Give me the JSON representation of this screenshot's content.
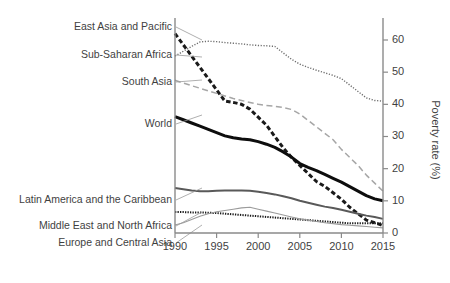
{
  "chart_data": {
    "type": "line",
    "title": "",
    "xlabel": "",
    "ylabel": "Poverty rate (%)",
    "xlim": [
      1990,
      2015
    ],
    "ylim": [
      0,
      65
    ],
    "grid": false,
    "legend_position": "left-labels-with-leader-lines",
    "x_ticks": [
      "1990",
      "1995",
      "2000",
      "2005",
      "2010",
      "2015"
    ],
    "y_ticks": [
      "0",
      "10",
      "20",
      "30",
      "40",
      "50",
      "60"
    ],
    "x": [
      1990,
      1991,
      1992,
      1993,
      1994,
      1995,
      1996,
      1997,
      1998,
      1999,
      2000,
      2001,
      2002,
      2003,
      2004,
      2005,
      2006,
      2007,
      2008,
      2009,
      2010,
      2011,
      2012,
      2013,
      2014,
      2015
    ],
    "series": [
      {
        "name": "East Asia and Pacific",
        "style": "thick-dashed",
        "color": "#1a1a1a",
        "values": [
          62.0,
          58.5,
          55.0,
          51.5,
          48.0,
          44.5,
          41.0,
          40.6,
          40.0,
          38.5,
          36.0,
          33.5,
          30.0,
          26.5,
          23.5,
          21.0,
          18.5,
          16.0,
          14.5,
          12.5,
          10.5,
          8.0,
          6.0,
          4.0,
          3.2,
          2.3
        ]
      },
      {
        "name": "Sub-Saharan Africa",
        "style": "fine-dotted",
        "color": "#6e6e6e",
        "values": [
          55.0,
          56.5,
          58.0,
          59.4,
          59.6,
          59.5,
          59.2,
          59.0,
          58.8,
          58.5,
          58.3,
          58.2,
          58.0,
          56.0,
          54.0,
          52.5,
          51.5,
          50.6,
          49.8,
          49.0,
          48.0,
          46.0,
          44.0,
          42.0,
          41.2,
          41.0
        ]
      },
      {
        "name": "South Asia",
        "style": "long-dashed",
        "color": "#a6a6a6",
        "values": [
          47.5,
          46.6,
          45.8,
          45.0,
          44.2,
          43.4,
          42.6,
          41.8,
          41.2,
          40.6,
          40.0,
          39.6,
          39.4,
          39.0,
          38.4,
          37.0,
          35.0,
          33.0,
          31.0,
          29.0,
          26.0,
          23.5,
          21.0,
          18.0,
          15.5,
          13.0
        ]
      },
      {
        "name": "World",
        "style": "thick-solid",
        "color": "#0d0d0d",
        "values": [
          36.2,
          35.2,
          34.2,
          33.2,
          32.2,
          31.2,
          30.2,
          29.6,
          29.2,
          29.0,
          28.4,
          27.6,
          26.6,
          25.2,
          23.6,
          21.6,
          20.4,
          19.4,
          18.2,
          17.0,
          15.8,
          14.4,
          13.0,
          11.6,
          10.6,
          10.0
        ]
      },
      {
        "name": "Latin America and the Caribbean",
        "style": "medium-solid",
        "color": "#595959",
        "values": [
          14.0,
          13.6,
          13.2,
          13.0,
          13.0,
          13.1,
          13.2,
          13.2,
          13.2,
          13.1,
          12.8,
          12.4,
          12.0,
          11.4,
          10.8,
          10.0,
          9.4,
          8.8,
          8.2,
          7.8,
          7.2,
          6.6,
          6.0,
          5.4,
          5.0,
          4.4
        ]
      },
      {
        "name": "Middle East and North Africa",
        "style": "fine-dotted-dark",
        "color": "#1a1a1a",
        "values": [
          6.5,
          6.5,
          6.4,
          6.4,
          6.3,
          6.2,
          6.0,
          5.8,
          5.6,
          5.4,
          5.2,
          5.0,
          4.8,
          4.6,
          4.4,
          4.2,
          4.0,
          3.8,
          3.6,
          3.4,
          3.2,
          3.0,
          3.0,
          3.0,
          3.0,
          3.0
        ]
      },
      {
        "name": "Europe and Central Asia",
        "style": "thin-solid",
        "color": "#9b9b9b",
        "values": [
          2.5,
          3.2,
          4.2,
          5.2,
          6.0,
          6.6,
          7.0,
          7.4,
          7.8,
          8.0,
          7.4,
          6.8,
          6.2,
          5.6,
          5.0,
          4.4,
          4.0,
          3.6,
          3.2,
          2.9,
          2.6,
          2.4,
          2.2,
          2.0,
          1.8,
          1.6
        ]
      }
    ],
    "label_anchors": [
      {
        "name": "East Asia and Pacific",
        "label_y": 27,
        "point_y": 40
      },
      {
        "name": "Sub-Saharan Africa",
        "label_y": 55,
        "point_y": 57
      },
      {
        "name": "South Asia",
        "label_y": 82,
        "point_y": 80
      },
      {
        "name": "World",
        "label_y": 124,
        "point_y": 115
      },
      {
        "name": "Latin America and the Caribbean",
        "label_y": 200,
        "point_y": 188
      },
      {
        "name": "Middle East and North Africa",
        "label_y": 226,
        "point_y": 212
      },
      {
        "name": "Europe and Central Asia",
        "label_y": 243,
        "point_y": 225
      }
    ]
  },
  "axes": {
    "y_axis_title": "Poverty rate (%)"
  }
}
